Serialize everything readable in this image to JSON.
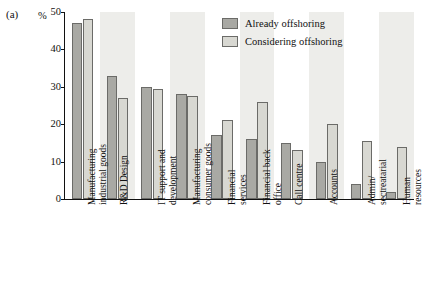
{
  "panel": {
    "label": "(a)"
  },
  "axis": {
    "unit": "%"
  },
  "legend": {
    "entries": [
      {
        "label": "Already offshoring",
        "color": "#a9a9a4"
      },
      {
        "label": "Considering offshoring",
        "color": "#d8d8d2"
      }
    ]
  },
  "chart_data": {
    "type": "bar",
    "title": "",
    "subtitle": "",
    "xlabel": "",
    "ylabel": "%",
    "ylim": [
      0,
      50
    ],
    "yticks": [
      0,
      10,
      20,
      30,
      40,
      50
    ],
    "grid": false,
    "legend_position": "top-right",
    "categories": [
      "Manufacturing\nindustrial goods",
      "R&D Design",
      "IT support and\ndevelopment",
      "Manufacturing\nconsumer goods",
      "Financial\nservices",
      "Financial back\noffice",
      "Call centre",
      "Accounts",
      "Admin/\nsectreatarial",
      "Human\nresources"
    ],
    "series": [
      {
        "name": "Already offshoring",
        "color": "#a9a9a4",
        "values": [
          47,
          33,
          30,
          28,
          17,
          16,
          15,
          10,
          4,
          2
        ]
      },
      {
        "name": "Considering offshoring",
        "color": "#d8d8d2",
        "values": [
          48,
          27,
          29.5,
          27.5,
          21,
          26,
          13,
          20,
          15.5,
          14
        ]
      }
    ]
  }
}
